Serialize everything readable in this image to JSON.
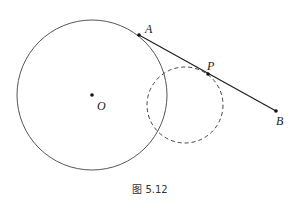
{
  "figure": {
    "caption": "图 5.12",
    "points": {
      "O": {
        "label": "O",
        "x": 92,
        "y": 95
      },
      "A": {
        "label": "A",
        "x": 139,
        "y": 35
      },
      "P": {
        "label": "P",
        "x": 208,
        "y": 74
      },
      "B": {
        "label": "B",
        "x": 276,
        "y": 111
      }
    },
    "circles": [
      {
        "name": "circle-O",
        "cx": 92,
        "cy": 95,
        "r": 75,
        "style": "solid"
      },
      {
        "name": "circle-P",
        "cx": 185,
        "cy": 105,
        "r": 38,
        "style": "dashed"
      }
    ],
    "segments": [
      {
        "from": "A",
        "to": "B"
      }
    ],
    "colors": {
      "stroke": "#444444",
      "line": "#222222"
    }
  }
}
